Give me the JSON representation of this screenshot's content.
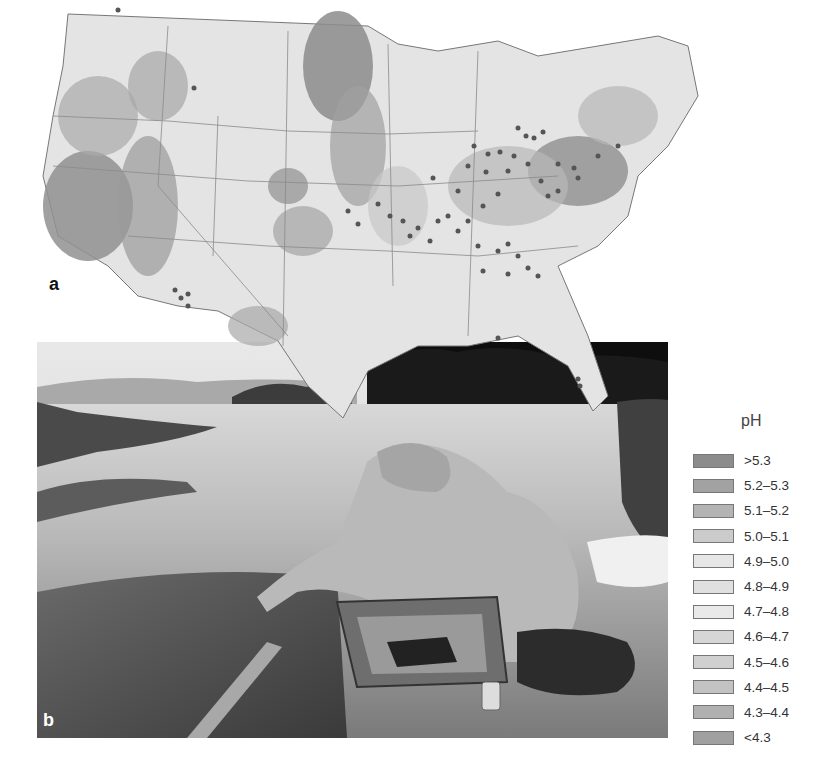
{
  "figure": {
    "panel_a_label": "a",
    "panel_b_label": "b",
    "map": {
      "subject": "Contiguous United States precipitation pH contour map",
      "marker_color": "#555555"
    },
    "photo": {
      "subject": "Person in rain jacket sampling water pH at lakeshore with field kit"
    }
  },
  "legend": {
    "title": "pH",
    "items": [
      {
        "label": ">5.3",
        "color": "#8c8c8c"
      },
      {
        "label": "5.2–5.3",
        "color": "#a2a2a2"
      },
      {
        "label": "5.1–5.2",
        "color": "#b4b4b4"
      },
      {
        "label": "5.0–5.1",
        "color": "#cbcbcb"
      },
      {
        "label": "4.9–5.0",
        "color": "#e6e6e6"
      },
      {
        "label": "4.8–4.9",
        "color": "#e0e0e0"
      },
      {
        "label": "4.7–4.8",
        "color": "#e9e9e9"
      },
      {
        "label": "4.6–4.7",
        "color": "#d6d6d6"
      },
      {
        "label": "4.5–4.6",
        "color": "#d0d0d0"
      },
      {
        "label": "4.4–4.5",
        "color": "#c2c2c2"
      },
      {
        "label": "4.3–4.4",
        "color": "#b0b0b0"
      },
      {
        "label": "<4.3",
        "color": "#a0a0a0"
      }
    ]
  }
}
